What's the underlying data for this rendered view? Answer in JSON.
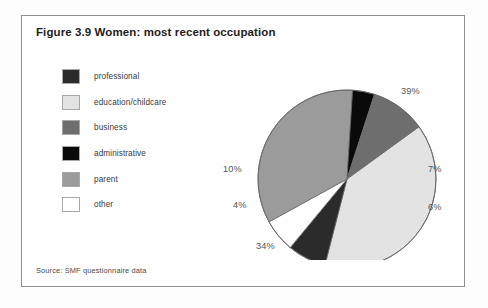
{
  "figure": {
    "title": "Figure 3.9 Women: most recent occupation",
    "source": "Source: SMF questionnaire data"
  },
  "legend": {
    "items": [
      {
        "label": "professional",
        "color": "#2b2b2b"
      },
      {
        "label": "education/childcare",
        "color": "#e3e3e3"
      },
      {
        "label": "business",
        "color": "#6e6e6e"
      },
      {
        "label": "administrative",
        "color": "#0a0a0a"
      },
      {
        "label": "parent",
        "color": "#9b9b9b"
      },
      {
        "label": "other",
        "color": "#ffffff"
      }
    ]
  },
  "chart_data": {
    "type": "pie",
    "title": "Figure 3.9 Women: most recent occupation",
    "xlabel": "",
    "ylabel": "",
    "legend_position": "left",
    "grid": false,
    "unit": "%",
    "categories": [
      "education/childcare",
      "professional",
      "other",
      "parent",
      "administrative",
      "business"
    ],
    "values": [
      39,
      7,
      6,
      34,
      4,
      10
    ],
    "colors": [
      "#e3e3e3",
      "#2b2b2b",
      "#ffffff",
      "#9b9b9b",
      "#0a0a0a",
      "#6e6e6e"
    ],
    "data_labels": [
      "39%",
      "7%",
      "6%",
      "34%",
      "4%",
      "10%"
    ],
    "start_angle_deg": -36,
    "direction": "clockwise"
  },
  "labels": {
    "p39": "39%",
    "p7": "7%",
    "p6": "6%",
    "p34": "34%",
    "p4": "4%",
    "p10": "10%"
  }
}
